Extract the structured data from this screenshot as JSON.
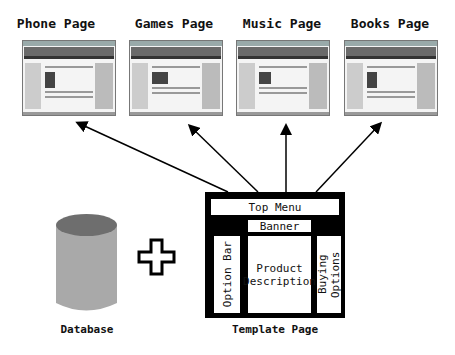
{
  "pages": [
    {
      "title": "Phone Page"
    },
    {
      "title": "Games Page"
    },
    {
      "title": "Music Page"
    },
    {
      "title": "Books Page"
    }
  ],
  "database": {
    "label": "Database",
    "icon": "database-cylinder-icon"
  },
  "plus": {
    "icon": "plus-icon"
  },
  "template": {
    "label": "Template Page",
    "top_menu": "Top Menu",
    "banner": "Banner",
    "option_bar": "Option Bar",
    "product_description_line1": "Product",
    "product_description_line2": "Description",
    "buying_options": "Buying Options"
  },
  "colors": {
    "cylinder_body": "#a9a9a9",
    "cylinder_top": "#6e6e6e",
    "frame": "#000000"
  }
}
